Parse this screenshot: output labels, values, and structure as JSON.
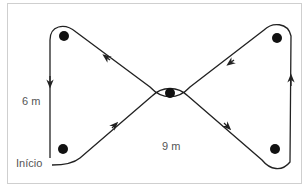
{
  "diagram": {
    "labels": {
      "vertical_distance": "6 m",
      "horizontal_distance": "9 m",
      "start": "Início"
    },
    "colors": {
      "path": "#222222",
      "cone": "#111111",
      "frame": "#cfcfcf",
      "text": "#555555"
    },
    "cones": [
      {
        "name": "top-left",
        "x": 64,
        "y": 36
      },
      {
        "name": "bottom-left",
        "x": 63,
        "y": 149
      },
      {
        "name": "center",
        "x": 170,
        "y": 93
      },
      {
        "name": "top-right",
        "x": 277,
        "y": 38
      },
      {
        "name": "bottom-right",
        "x": 275,
        "y": 149
      }
    ]
  }
}
